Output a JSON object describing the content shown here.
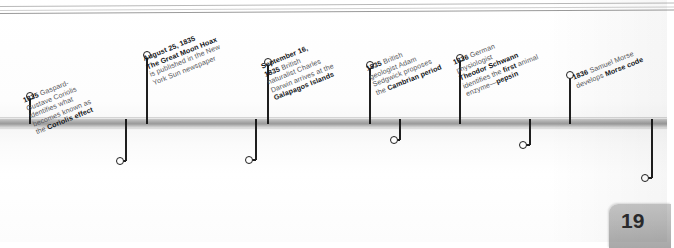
{
  "page": {
    "number": "19",
    "accent_color": "#b0b0b0",
    "text_color": "#57585c",
    "emphasis_color": "#111316"
  },
  "timeline": {
    "name": "1835-1836 science and invention timeline",
    "bar_color": "#a9a9a9"
  },
  "events": [
    {
      "id": "coriolis",
      "side": "above",
      "year": "1835",
      "lines": [
        {
          "text": "1835",
          "bold": true
        },
        {
          "text": " Gaspard-",
          "bold": false
        },
        {
          "text": "Gustave Coriolis",
          "bold": false
        },
        {
          "text": "identifies what",
          "bold": false
        },
        {
          "text": "becomes known as",
          "bold": false
        },
        {
          "text": "the ",
          "bold": false
        },
        {
          "text": "Coriolis effect",
          "bold": true
        }
      ],
      "display": [
        "1835 Gaspard-",
        "Gustave Coriolis",
        "identifies what",
        "becomes known as",
        "the Coriolis effect"
      ]
    },
    {
      "id": "moon-hoax",
      "side": "above",
      "year": "August 25, 1835",
      "display": [
        "August 25, 1835",
        "The Great Moon Hoax",
        "is published in the New",
        "York Sun newspaper"
      ]
    },
    {
      "id": "darwin-galapagos",
      "side": "above",
      "year": "September 16, 1835",
      "display": [
        "September 16,",
        "1835 British",
        "naturalist Charles",
        "Darwin arrives at the",
        "Galapagos Islands"
      ]
    },
    {
      "id": "cambrian",
      "side": "above",
      "year": "1835",
      "display": [
        "1835 British",
        "geologist Adam",
        "Sedgwick proposes",
        "the Cambrian period"
      ]
    },
    {
      "id": "pepsin",
      "side": "above",
      "year": "1836",
      "display": [
        "1836 German",
        "physiologist",
        "Theodor Schwann",
        "identifies the first animal",
        "enzyme—pepsin"
      ]
    },
    {
      "id": "morse-code",
      "side": "above",
      "year": "1836",
      "display": [
        "1836 Samuel Morse",
        "develops Morse code"
      ]
    },
    {
      "id": "women-astronomers",
      "side": "below",
      "year": "1835",
      "display": [
        "1835 British astronomers",
        "Caroline Herschel and Mary",
        "Somerville become the",
        "first female members of the",
        "Royal Astronomical Society"
      ]
    },
    {
      "id": "photographic-negative",
      "side": "below",
      "year": "1835",
      "display": [
        "1835 Henry Fox Talbot",
        "produces the world's first",
        "photographic negative"
      ]
    },
    {
      "id": "silurian",
      "side": "below",
      "year": "1835",
      "display": [
        "1835 Roderick",
        "Murchison proposes",
        "the Silurian period"
      ]
    },
    {
      "id": "acetylene",
      "side": "below",
      "year": "1836",
      "display": [
        "1836 Irish chemist",
        "Edmund Davy",
        "discovers acetylene"
      ]
    },
    {
      "id": "colt-revolver",
      "side": "below",
      "year": "1836",
      "display": [
        "1836 Samuel Colt",
        "is granted a US",
        "patent for the",
        "revolver"
      ]
    }
  ]
}
